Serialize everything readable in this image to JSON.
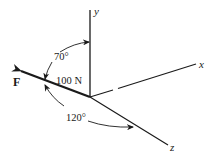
{
  "diagram": {
    "type": "3d-force-vector",
    "axes": {
      "x": {
        "label": "x"
      },
      "y": {
        "label": "y"
      },
      "z": {
        "label": "z"
      }
    },
    "force": {
      "label": "F",
      "magnitude": "100 N"
    },
    "angles": [
      {
        "label": "70°",
        "between": [
          "F",
          "y"
        ]
      },
      {
        "label": "120°",
        "between": [
          "F",
          "z"
        ]
      }
    ],
    "colors": {
      "line": "#1a1a1a",
      "background": "#ffffff"
    }
  }
}
